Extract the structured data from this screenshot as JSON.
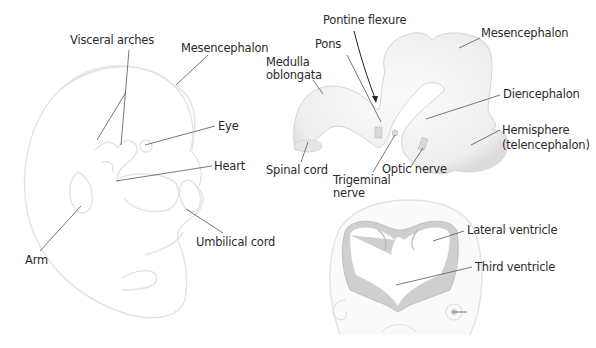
{
  "embryo_labels": {
    "visceral_arches": "Visceral arches",
    "mesencephalon": "Mesencephalon",
    "eye": "Eye",
    "heart": "Heart",
    "umbilical_cord": "Umbilical cord",
    "arm": "Arm"
  },
  "brain_labels": {
    "pontine_flexure": "Pontine flexure",
    "pons": "Pons",
    "medulla_line1": "Medulla",
    "medulla_line2": "oblongata",
    "mesencephalon": "Mesencephalon",
    "diencephalon": "Diencephalon",
    "hemisphere_line1": "Hemisphere",
    "hemisphere_line2": "(telencephalon)",
    "spinal_cord": "Spinal cord",
    "trigeminal_line1": "Trigeminal",
    "trigeminal_line2": "nerve",
    "optic_nerve": "Optic nerve"
  },
  "section_labels": {
    "lateral_ventricle": "Lateral ventricle",
    "third_ventricle": "Third ventricle"
  },
  "colors": {
    "outline_light": "#e2e2e2",
    "fill_light": "#f1f1f1",
    "ventricle_wall": "#cfcfcf",
    "leader_line": "#555555",
    "text": "#2b2b2b"
  }
}
